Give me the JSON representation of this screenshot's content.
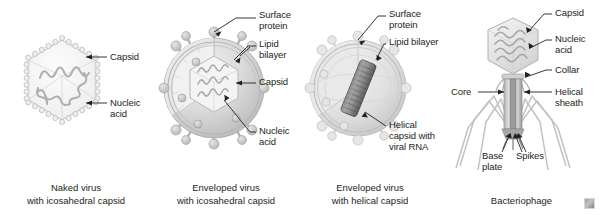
{
  "figure": {
    "background_color": "#ffffff",
    "text_color": "#231f20",
    "fill_light": "#e3e3e3",
    "fill_mid": "#c9c9c9",
    "fill_dark": "#9a9a9a",
    "stroke_color": "#8e8e8e",
    "leader_color": "#231f20",
    "watermark": "watermark-logo"
  },
  "panels": [
    {
      "id": "naked-virus",
      "caption": "Naked virus\nwith icosahedral capsid",
      "labels": [
        {
          "id": "capsid",
          "text": "Capsid"
        },
        {
          "id": "nucleic-acid",
          "text": "Nucleic\nacid"
        }
      ]
    },
    {
      "id": "enveloped-icosahedral",
      "caption": "Enveloped virus\nwith icosahedral capsid",
      "labels": [
        {
          "id": "surface-protein",
          "text": "Surface\nprotein"
        },
        {
          "id": "lipid-bilayer",
          "text": "Lipid bilayer"
        },
        {
          "id": "capsid",
          "text": "Capsid"
        },
        {
          "id": "nucleic-acid",
          "text": "Nucleic\nacid"
        }
      ]
    },
    {
      "id": "enveloped-helical",
      "caption": "Enveloped virus\nwith helical capsid",
      "labels": [
        {
          "id": "surface-protein",
          "text": "Surface\nprotein"
        },
        {
          "id": "lipid-bilayer",
          "text": "Lipid bilayer"
        },
        {
          "id": "helical-capsid",
          "text": "Helical\ncapsid with\nviral RNA"
        }
      ]
    },
    {
      "id": "bacteriophage",
      "caption": "Bacteriophage",
      "labels": [
        {
          "id": "capsid",
          "text": "Capsid"
        },
        {
          "id": "nucleic-acid",
          "text": "Nucleic\nacid"
        },
        {
          "id": "collar",
          "text": "Collar"
        },
        {
          "id": "helical-sheath",
          "text": "Helical sheath"
        },
        {
          "id": "core",
          "text": "Core"
        },
        {
          "id": "base-plate",
          "text": "Base\nplate"
        },
        {
          "id": "spikes",
          "text": "Spikes"
        }
      ]
    }
  ]
}
